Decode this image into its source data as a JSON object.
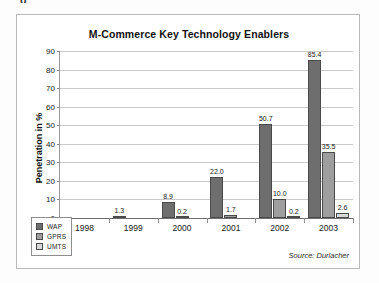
{
  "top_artifact": "g",
  "chart_data": {
    "type": "bar",
    "title": "M-Commerce Key Technology Enablers",
    "xlabel": "",
    "ylabel": "Penetration in %",
    "ylim": [
      0,
      90
    ],
    "ytick_step": 10,
    "yticks": [
      "90",
      "80",
      "70",
      "60",
      "50",
      "40",
      "30",
      "20",
      "10",
      "0"
    ],
    "grid": true,
    "legend_position": "bottom-left",
    "categories": [
      "1998",
      "1999",
      "2000",
      "2001",
      "2002",
      "2003"
    ],
    "series": [
      {
        "name": "WAP",
        "color": "#6e6e6e",
        "values": [
          null,
          1.3,
          8.9,
          22.0,
          50.7,
          85.4
        ],
        "labels": [
          "",
          "1.3",
          "8.9",
          "22.0",
          "50.7",
          "85.4"
        ]
      },
      {
        "name": "GPRS",
        "color": "#9e9e9e",
        "values": [
          null,
          null,
          0.2,
          1.7,
          10.0,
          35.5
        ],
        "labels": [
          "",
          "",
          "0.2",
          "1.7",
          "10.0",
          "35.5"
        ]
      },
      {
        "name": "UMTS",
        "color": "#d8d8d8",
        "values": [
          null,
          null,
          null,
          null,
          0.2,
          2.6
        ],
        "labels": [
          "",
          "",
          "",
          "",
          "0.2",
          "2.6"
        ]
      }
    ],
    "source": "Source: Durlacher"
  }
}
